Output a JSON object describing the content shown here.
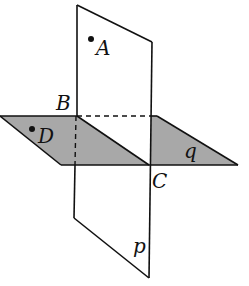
{
  "diagram": {
    "colors": {
      "stroke": "#111111",
      "shade": "#a8a8a8",
      "background": "#ffffff"
    },
    "planes": [
      {
        "id": "p",
        "label": "p",
        "orientation": "vertical"
      },
      {
        "id": "q",
        "label": "q",
        "orientation": "horizontal",
        "shaded": true
      }
    ],
    "points": [
      {
        "id": "A",
        "label": "A",
        "on_plane": "p",
        "marked": true
      },
      {
        "id": "B",
        "label": "B",
        "marked": false
      },
      {
        "id": "C",
        "label": "C",
        "marked": false
      },
      {
        "id": "D",
        "label": "D",
        "on_plane": "q",
        "marked": true
      }
    ],
    "lines": [
      {
        "id": "BC",
        "description": "intersection line of planes p and q"
      }
    ]
  },
  "labels": {
    "A": "A",
    "B": "B",
    "C": "C",
    "D": "D",
    "p": "p",
    "q": "q"
  }
}
